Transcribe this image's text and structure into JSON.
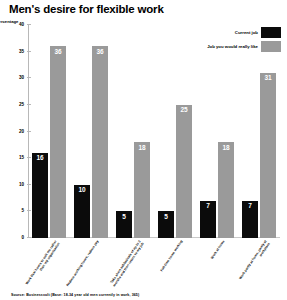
{
  "chart_data": {
    "type": "bar",
    "title": "Men's desire for flexible work",
    "xlabel": "",
    "ylabel": "percentage",
    "ylim": [
      0,
      40
    ],
    "ytick_labels": [
      "0",
      "5",
      "10",
      "15",
      "20",
      "25",
      "30",
      "35",
      "40"
    ],
    "ytick_values": [
      0,
      5,
      10,
      15,
      20,
      25,
      30,
      35,
      40
    ],
    "grid": false,
    "legend_position": "top-right",
    "categories": [
      "Work flexi hours to suit me rather than my organisation",
      "Reduce working hours, reduce pay",
      "Take short sabbaticals of up to 3 months and then return to my job",
      "Full-time home working",
      "Work at home",
      "Work partly at home, partly at workplace"
    ],
    "series": [
      {
        "name": "Current job",
        "color": "#0b0b0b",
        "values": [
          16,
          10,
          5,
          5,
          7,
          7
        ]
      },
      {
        "name": "Job you would really like",
        "color": "#9a9a9a",
        "values": [
          36,
          36,
          18,
          25,
          18,
          31
        ]
      }
    ],
    "source": "Source: Businessvolt (Base: 18-34 year old men currently in work, 365)"
  }
}
